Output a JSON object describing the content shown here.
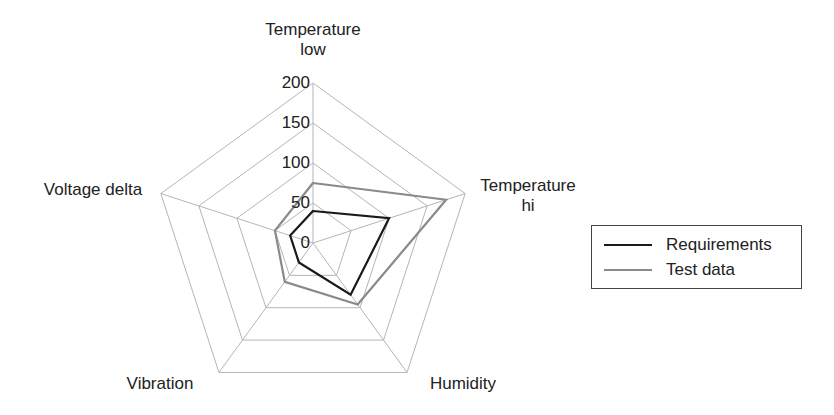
{
  "chart_data": {
    "type": "radar",
    "title": "",
    "axes": [
      "Temperature low",
      "Temperature hi",
      "Humidity",
      "Vibration",
      "Voltage delta"
    ],
    "axis_labels_display": [
      [
        "Temperature",
        "low"
      ],
      [
        "Temperature",
        "hi"
      ],
      [
        "Humidity"
      ],
      [
        "Vibration"
      ],
      [
        "Voltage delta"
      ]
    ],
    "radial_ticks": [
      "0",
      "50",
      "100",
      "150",
      "200"
    ],
    "rlim": [
      0,
      200
    ],
    "grid": true,
    "legend_position": "right",
    "series": [
      {
        "name": "Requirements",
        "color": "#1a1a1a",
        "values": [
          40,
          100,
          80,
          30,
          30
        ]
      },
      {
        "name": "Test data",
        "color": "#8a8a8a",
        "values": [
          75,
          175,
          95,
          60,
          50
        ]
      }
    ]
  },
  "legend": {
    "items": [
      {
        "label": "Requirements",
        "color": "#1a1a1a"
      },
      {
        "label": "Test data",
        "color": "#8a8a8a"
      }
    ]
  },
  "labels": {
    "temp_low_line1": "Temperature",
    "temp_low_line2": "low",
    "temp_hi_line1": "Temperature",
    "temp_hi_line2": "hi",
    "humidity": "Humidity",
    "vibration": "Vibration",
    "voltage_delta": "Voltage delta"
  },
  "ticks": {
    "t0": "0",
    "t50": "50",
    "t100": "100",
    "t150": "150",
    "t200": "200"
  }
}
